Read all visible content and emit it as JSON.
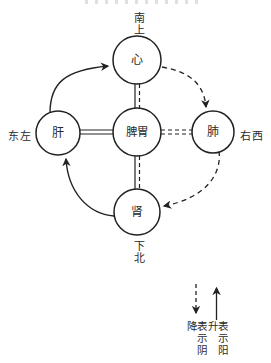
{
  "diagram": {
    "orientation_labels": {
      "top": "南上",
      "left": "东左",
      "right": "右西",
      "bottom": "下北"
    },
    "nodes": {
      "heart": "心",
      "liver": "肝",
      "spleen_stomach": "脾胃",
      "lung": "肺",
      "kidney": "肾"
    },
    "legend": {
      "yin_descending": "表示阴降",
      "yang_rising": "表示阳升"
    },
    "colors": {
      "ink": "#222222",
      "background": "#ffffff"
    }
  }
}
